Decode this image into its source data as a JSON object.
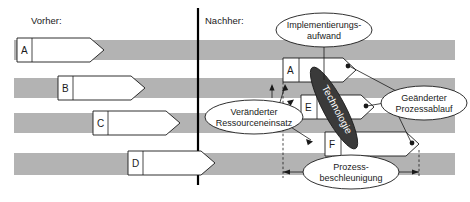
{
  "figure": {
    "headers": {
      "before": "Vorher:",
      "after": "Nachher:"
    },
    "colors": {
      "band": "#b3b3b3",
      "task_fill": "#ffffff",
      "stroke": "#1a1a1a",
      "technology_fill": "#3a3a3a",
      "background": "#ffffff"
    },
    "before_tasks": [
      {
        "label": "A"
      },
      {
        "label": "B"
      },
      {
        "label": "C"
      },
      {
        "label": "D"
      }
    ],
    "after_tasks": [
      {
        "label": "A"
      },
      {
        "label": "E"
      },
      {
        "label": "F"
      }
    ],
    "technology": {
      "label": "Technologie"
    },
    "annotations": [
      {
        "name": "implementation-effort",
        "line1": "Implementierungs-",
        "line2": "aufwand"
      },
      {
        "name": "changed-resource-usage",
        "line1": "Veränderter",
        "line2": "Ressourceneinsatz"
      },
      {
        "name": "changed-process-flow",
        "line1": "Geänderter",
        "line2": "Prozessablauf"
      },
      {
        "name": "process-acceleration",
        "line1": "Prozess-",
        "line2": "beschleunigung"
      }
    ]
  }
}
